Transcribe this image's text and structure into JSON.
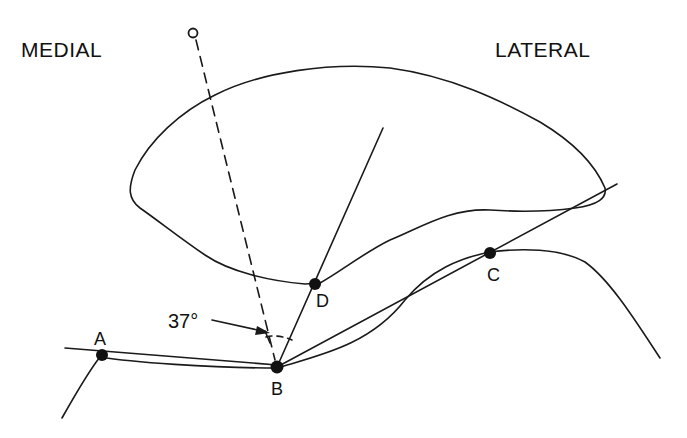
{
  "diagram": {
    "type": "anatomical-line-diagram",
    "side_labels": {
      "left": "MEDIAL",
      "right": "LATERAL"
    },
    "angle_label": "37°",
    "points": [
      {
        "id": "A",
        "label": "A",
        "x": 102,
        "y": 355
      },
      {
        "id": "B",
        "label": "B",
        "x": 277,
        "y": 367
      },
      {
        "id": "C",
        "label": "C",
        "x": 490,
        "y": 253
      },
      {
        "id": "D",
        "label": "D",
        "x": 315,
        "y": 284
      }
    ],
    "reference_marker": {
      "label": "o",
      "x": 193,
      "y": 33
    },
    "colors": {
      "line": "#1a1a1a",
      "background": "#ffffff"
    }
  }
}
